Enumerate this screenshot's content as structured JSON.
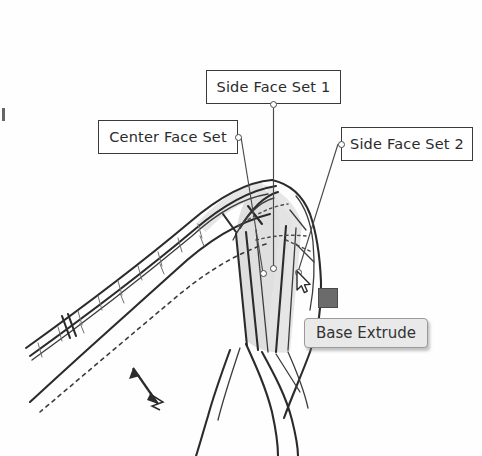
{
  "figure": {
    "kind": "cad-viewport-screenshot",
    "background_color": "#fefefe",
    "line_color": "#2b2b2b",
    "highlight_face_color": "#d8d8d8"
  },
  "callouts": [
    {
      "id": "side-face-set-1",
      "label": "Side Face Set 1",
      "anchor_side": "bottom",
      "border_color": "#3a3a3a",
      "text_color": "#2b2b2b"
    },
    {
      "id": "center-face-set",
      "label": "Center Face Set",
      "anchor_side": "right",
      "border_color": "#3a3a3a",
      "text_color": "#2b2b2b"
    },
    {
      "id": "side-face-set-2",
      "label": "Side Face Set 2",
      "anchor_side": "left",
      "border_color": "#3a3a3a",
      "text_color": "#2b2b2b"
    }
  ],
  "tooltip": {
    "label": "Base Extrude",
    "background_color": "#e9e9e9",
    "border_color": "#9a9a9a",
    "text_color": "#333333"
  },
  "cursor": {
    "icon": "arrow-pointer-icon",
    "drag_indicator": "drag-square-icon",
    "drag_indicator_color": "#6b6b6b"
  },
  "view_indicator": {
    "icon": "double-arrow-axis-icon"
  }
}
